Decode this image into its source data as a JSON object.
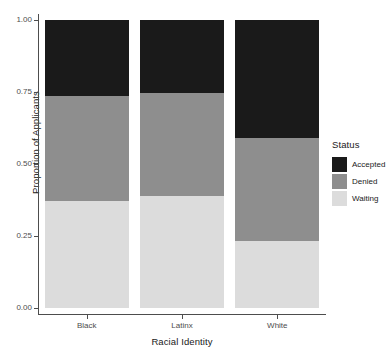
{
  "chart_data": {
    "type": "bar",
    "stacked": true,
    "stack_mode": "proportion",
    "title": "",
    "subtitle": "",
    "xlabel": "Racial Identity",
    "ylabel": "Proportion of Applicants",
    "categories": [
      "Black",
      "Latinx",
      "White"
    ],
    "ylim": [
      0.0,
      1.0
    ],
    "yticks": [
      0.0,
      0.25,
      0.5,
      0.75,
      1.0
    ],
    "ytick_labels": [
      "0.00",
      "0.25",
      "0.50",
      "0.75",
      "1.00"
    ],
    "grid": false,
    "legend_position": "right",
    "legend_title": "Status",
    "stack_order_top_to_bottom": [
      "Accepted",
      "Denied",
      "Waiting"
    ],
    "series": [
      {
        "name": "Accepted",
        "color": "#1a1a1a",
        "values": [
          0.264,
          0.253,
          0.41
        ]
      },
      {
        "name": "Denied",
        "color": "#8e8e8e",
        "values": [
          0.364,
          0.358,
          0.357
        ]
      },
      {
        "name": "Waiting",
        "color": "#dcdcdc",
        "values": [
          0.372,
          0.389,
          0.233
        ]
      }
    ],
    "cumulative_tops": {
      "Black": {
        "waiting": 0.372,
        "denied": 0.736,
        "accepted": 1.0
      },
      "Latinx": {
        "waiting": 0.389,
        "denied": 0.747,
        "accepted": 1.0
      },
      "White": {
        "waiting": 0.233,
        "denied": 0.59,
        "accepted": 1.0
      }
    }
  },
  "axes": {
    "y_title": "Proportion of Applicants",
    "x_title": "Racial Identity",
    "y_tick_labels": [
      "0.00",
      "0.25",
      "0.50",
      "0.75",
      "1.00"
    ],
    "x_tick_labels": [
      "Black",
      "Latinx",
      "White"
    ]
  },
  "legend": {
    "title": "Status",
    "items": [
      {
        "label": "Accepted",
        "color": "#1a1a1a"
      },
      {
        "label": "Denied",
        "color": "#8e8e8e"
      },
      {
        "label": "Waiting",
        "color": "#dcdcdc"
      }
    ]
  }
}
